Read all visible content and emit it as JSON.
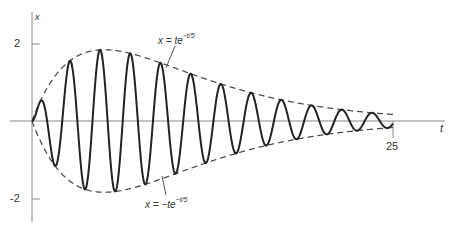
{
  "chart_data": {
    "type": "line",
    "title": "",
    "xlabel": "t",
    "ylabel": "x",
    "xlim": [
      0,
      25
    ],
    "ylim": [
      -2,
      2
    ],
    "x_ticks": [
      "25"
    ],
    "y_ticks": [
      "2",
      "-2"
    ],
    "grid": false,
    "series": [
      {
        "name": "x = t e^{-t/5} sin(3t)",
        "style": "solid",
        "formula": "t*exp(-t/5)*sin(3t)"
      },
      {
        "name": "x = te^{-t/5}",
        "style": "dashed",
        "formula": "t*exp(-t/5)"
      },
      {
        "name": "x = -te^{-t/5}",
        "style": "dashed",
        "formula": "-t*exp(-t/5)"
      }
    ],
    "annotations": [
      {
        "text": "x = te^{-t/5}",
        "target": "upper envelope"
      },
      {
        "text": "x = -te^{-t/5}",
        "target": "lower envelope"
      }
    ]
  },
  "labels": {
    "y_axis": "x",
    "x_axis": "t",
    "tick_2": "2",
    "tick_neg2": "-2",
    "tick_25": "25",
    "upper_prefix": "x = te",
    "upper_exp": "−t/5",
    "lower_prefix": "x = −te",
    "lower_exp": "−t/5"
  }
}
